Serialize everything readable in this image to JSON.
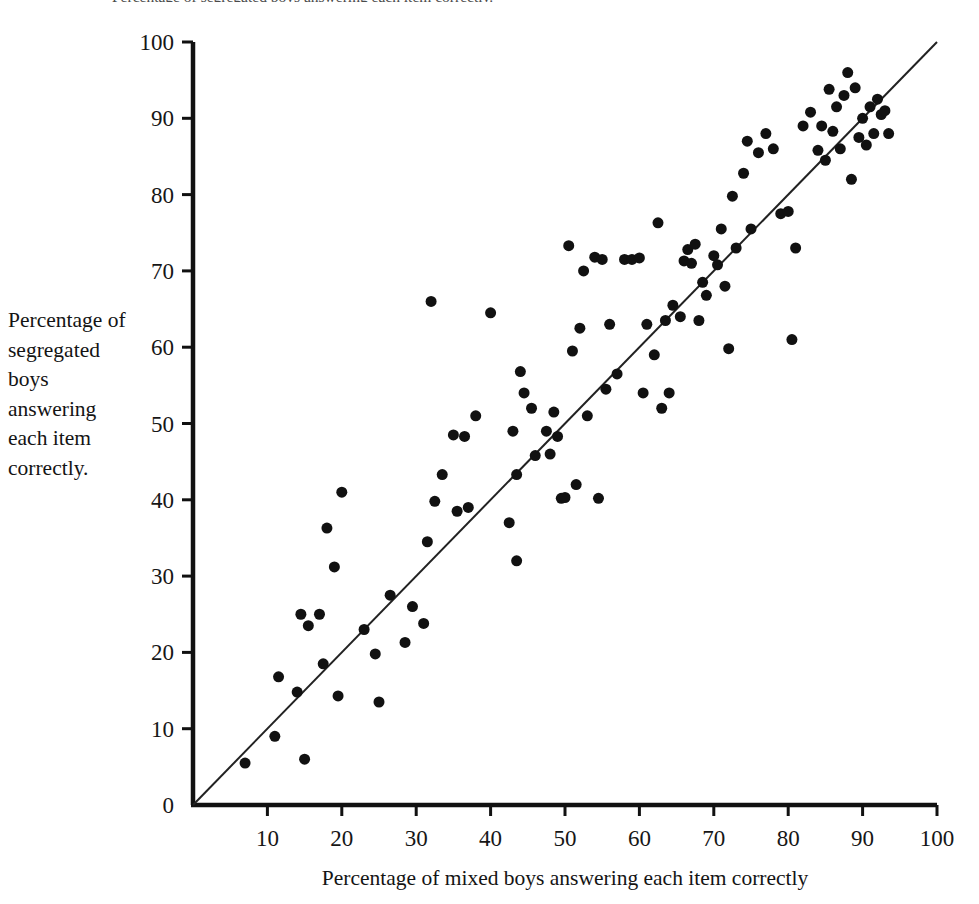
{
  "figure": {
    "top_caption_fragment": "Percentage of segregated boys answering each item correctly.",
    "background_color": "#ffffff",
    "marker_color": "#111111",
    "axis_color": "#111111",
    "reference_line_color": "#222222"
  },
  "chart_data": {
    "type": "scatter",
    "title": "",
    "xlabel": "Percentage of mixed boys answering each item correctly",
    "ylabel": "Percentage of segregated boys answering each item correctly.",
    "xlim": [
      0,
      100
    ],
    "ylim": [
      0,
      100
    ],
    "xticks": [
      0,
      10,
      20,
      30,
      40,
      50,
      60,
      70,
      80,
      90,
      100
    ],
    "yticks": [
      0,
      10,
      20,
      30,
      40,
      50,
      60,
      70,
      80,
      90,
      100
    ],
    "xtick_labels": [
      "",
      "10",
      "20",
      "30",
      "40",
      "50",
      "60",
      "70",
      "80",
      "90",
      "100"
    ],
    "ytick_labels": [
      "0",
      "10",
      "20",
      "30",
      "40",
      "50",
      "60",
      "70",
      "80",
      "90",
      "100"
    ],
    "grid": false,
    "legend": null,
    "marker_size_px": 11,
    "reference_line": {
      "label": "identity line y = x",
      "x": [
        0,
        100
      ],
      "y": [
        0,
        100
      ]
    },
    "series": [
      {
        "name": "Test items",
        "marker": "filled-circle",
        "color": "#111111",
        "points": [
          [
            7,
            5.5
          ],
          [
            11,
            9
          ],
          [
            11.5,
            16.8
          ],
          [
            14,
            14.8
          ],
          [
            14.5,
            25
          ],
          [
            15,
            6
          ],
          [
            15.5,
            23.5
          ],
          [
            17,
            25
          ],
          [
            17.5,
            18.5
          ],
          [
            18,
            36.3
          ],
          [
            19,
            31.2
          ],
          [
            19.5,
            14.3
          ],
          [
            20,
            41
          ],
          [
            23,
            23
          ],
          [
            24.5,
            19.8
          ],
          [
            25,
            13.5
          ],
          [
            26.5,
            27.5
          ],
          [
            28.5,
            21.3
          ],
          [
            29.5,
            26
          ],
          [
            31,
            23.8
          ],
          [
            31.5,
            34.5
          ],
          [
            32,
            66
          ],
          [
            32.5,
            39.8
          ],
          [
            33.5,
            43.3
          ],
          [
            35,
            48.5
          ],
          [
            35.5,
            38.5
          ],
          [
            36.5,
            48.3
          ],
          [
            37,
            39
          ],
          [
            38,
            51
          ],
          [
            40,
            64.5
          ],
          [
            42.5,
            37
          ],
          [
            43,
            49
          ],
          [
            43.5,
            43.3
          ],
          [
            43.5,
            32
          ],
          [
            44,
            56.8
          ],
          [
            44.5,
            54
          ],
          [
            45.5,
            52
          ],
          [
            46,
            45.8
          ],
          [
            47.5,
            49
          ],
          [
            48,
            46
          ],
          [
            48.5,
            51.5
          ],
          [
            49,
            48.3
          ],
          [
            49.5,
            40.2
          ],
          [
            50,
            40.3
          ],
          [
            50.5,
            73.3
          ],
          [
            51,
            59.5
          ],
          [
            51.5,
            42
          ],
          [
            52,
            62.5
          ],
          [
            52.5,
            70
          ],
          [
            53,
            51
          ],
          [
            54,
            71.8
          ],
          [
            54.5,
            40.2
          ],
          [
            55,
            71.5
          ],
          [
            55.5,
            54.5
          ],
          [
            56,
            63
          ],
          [
            57,
            56.5
          ],
          [
            58,
            71.5
          ],
          [
            59,
            71.5
          ],
          [
            60,
            71.7
          ],
          [
            60.5,
            54
          ],
          [
            61,
            63
          ],
          [
            62,
            59
          ],
          [
            62.5,
            76.3
          ],
          [
            63,
            52
          ],
          [
            63.5,
            63.5
          ],
          [
            64,
            54
          ],
          [
            64.5,
            65.5
          ],
          [
            65.5,
            64
          ],
          [
            66,
            71.3
          ],
          [
            66.5,
            72.8
          ],
          [
            67,
            71
          ],
          [
            67.5,
            73.5
          ],
          [
            68,
            63.5
          ],
          [
            68.5,
            68.5
          ],
          [
            69,
            66.8
          ],
          [
            70,
            72
          ],
          [
            70.5,
            70.8
          ],
          [
            71,
            75.5
          ],
          [
            71.5,
            68
          ],
          [
            72,
            59.8
          ],
          [
            72.5,
            79.8
          ],
          [
            73,
            73
          ],
          [
            74,
            82.8
          ],
          [
            74.5,
            87
          ],
          [
            75,
            75.5
          ],
          [
            76,
            85.5
          ],
          [
            77,
            88
          ],
          [
            78,
            86
          ],
          [
            79,
            77.5
          ],
          [
            80,
            77.8
          ],
          [
            80.5,
            61
          ],
          [
            81,
            73
          ],
          [
            82,
            89
          ],
          [
            83,
            90.8
          ],
          [
            84,
            85.8
          ],
          [
            84.5,
            89
          ],
          [
            85,
            84.5
          ],
          [
            85.5,
            93.8
          ],
          [
            86,
            88.3
          ],
          [
            86.5,
            91.5
          ],
          [
            87,
            86
          ],
          [
            87.5,
            93
          ],
          [
            88,
            96
          ],
          [
            88.5,
            82
          ],
          [
            89,
            94
          ],
          [
            89.5,
            87.5
          ],
          [
            90,
            90
          ],
          [
            90.5,
            86.5
          ],
          [
            91,
            91.5
          ],
          [
            91.5,
            88
          ],
          [
            92,
            92.5
          ],
          [
            92.5,
            90.5
          ],
          [
            93,
            91
          ],
          [
            93.5,
            88
          ]
        ]
      }
    ]
  }
}
